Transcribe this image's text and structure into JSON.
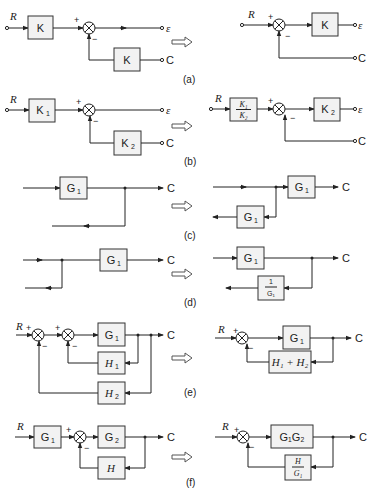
{
  "figure": {
    "panels": [
      {
        "id": "a",
        "caption": "(a)",
        "left": {
          "input": "R",
          "forward_block": "K",
          "feedback_block": "K",
          "output_error": "ε",
          "output": "C",
          "plus": "+",
          "minus": "−"
        },
        "right": {
          "input": "R",
          "forward_block": "K",
          "output_error": "ε",
          "output": "C",
          "plus": "+",
          "minus": "−"
        }
      },
      {
        "id": "b",
        "caption": "(b)",
        "left": {
          "input": "R",
          "forward_block": "K",
          "forward_sub": "1",
          "feedback_block": "K",
          "feedback_sub": "2",
          "output_error": "ε",
          "output": "C",
          "plus": "+",
          "minus": "−"
        },
        "right": {
          "input": "R",
          "pre_block_num": "K₁",
          "pre_block_den": "K₂",
          "forward_block": "K",
          "forward_sub": "2",
          "output_error": "ε",
          "output": "C",
          "plus": "+",
          "minus": "−"
        }
      },
      {
        "id": "c",
        "caption": "(c)",
        "left": {
          "block": "G",
          "block_sub": "1",
          "output": "C"
        },
        "right": {
          "block": "G",
          "block_sub": "1",
          "branch_block": "G",
          "branch_sub": "1",
          "output": "C"
        }
      },
      {
        "id": "d",
        "caption": "(d)",
        "left": {
          "block": "G",
          "block_sub": "1",
          "output": "C"
        },
        "right": {
          "block": "G",
          "block_sub": "1",
          "branch_num": "1",
          "branch_den": "G₁",
          "output": "C"
        }
      },
      {
        "id": "e",
        "caption": "(e)",
        "left": {
          "input": "R",
          "forward_block": "G",
          "forward_sub": "1",
          "fb1": "H",
          "fb1_sub": "1",
          "fb2": "H",
          "fb2_sub": "2",
          "output": "C",
          "plus": "+",
          "minus": "−"
        },
        "right": {
          "input": "R",
          "forward_block": "G",
          "forward_sub": "1",
          "feedback_block": "H₁ + H₂",
          "output": "C",
          "plus": "+",
          "minus": "−"
        }
      },
      {
        "id": "f",
        "caption": "(f)",
        "left": {
          "input": "R",
          "pre_block": "G",
          "pre_sub": "1",
          "forward_block": "G",
          "forward_sub": "2",
          "feedback_block": "H",
          "output": "C",
          "plus": "+",
          "minus": "−"
        },
        "right": {
          "input": "R",
          "forward_block": "G₁G₂",
          "feedback_num": "H",
          "feedback_den": "G₁",
          "output": "C",
          "plus": "+",
          "minus": "−"
        }
      }
    ]
  }
}
